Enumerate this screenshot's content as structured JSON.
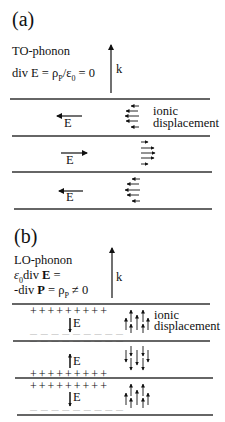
{
  "panel_a": {
    "label": "(a)",
    "title": "TO-phonon",
    "equation": "div E = ρP/ε0 = 0",
    "equation_parts": {
      "lhs": "div E = ρ",
      "sub1": "P",
      "mid": "/ε",
      "sub2": "0",
      "rhs": " = 0"
    },
    "k_label": "k",
    "ionic_label_1": "ionic",
    "ionic_label_2": "displacement",
    "layers": [
      {
        "field_label": "E",
        "field_direction": "left",
        "ion_direction": "left"
      },
      {
        "field_label": "E",
        "field_direction": "right",
        "ion_direction": "right"
      },
      {
        "field_label": "E",
        "field_direction": "left",
        "ion_direction": "left"
      }
    ]
  },
  "panel_b": {
    "label": "(b)",
    "title": "LO-phonon",
    "equation_line1": "ε0div E =",
    "eq1_parts": {
      "eps": "ε",
      "sub": "0",
      "div": "div ",
      "E": "E",
      "rest": " ="
    },
    "equation_line2": "-div P = ρP ≠ 0",
    "eq2_parts": {
      "pre": "-div ",
      "P": "P",
      "mid": " = ρ",
      "sub": "P",
      "rest": " ≠ 0"
    },
    "k_label": "k",
    "ionic_label_1": "ionic",
    "ionic_label_2": "displacement",
    "plus_row": "+ + + + + + + + +",
    "minus_row": "— — — — — — — — —",
    "layers": [
      {
        "field_label": "E",
        "field_direction": "down",
        "ion_direction": "up"
      },
      {
        "field_label": "E",
        "field_direction": "up",
        "ion_direction": "down"
      },
      {
        "field_label": "E",
        "field_direction": "down",
        "ion_direction": "up"
      }
    ]
  }
}
